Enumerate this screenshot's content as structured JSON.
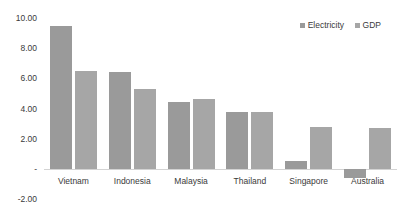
{
  "chart_data": {
    "type": "bar",
    "title": "",
    "subtitle": "",
    "xlabel": "",
    "ylabel": "",
    "categories": [
      "Vietnam",
      "Indonesia",
      "Malaysia",
      "Thailand",
      "Singapore",
      "Australia"
    ],
    "series": [
      {
        "name": "Electricity",
        "color": "#9a9a9a",
        "values": [
          9.5,
          6.4,
          4.4,
          3.8,
          0.5,
          -0.6
        ]
      },
      {
        "name": "GDP",
        "color": "#a6a6a6",
        "values": [
          6.5,
          5.3,
          4.6,
          3.8,
          2.8,
          2.7
        ]
      }
    ],
    "ylim": [
      -2.0,
      10.0
    ],
    "ytick_values": [
      10.0,
      8.0,
      6.0,
      4.0,
      2.0,
      0.0,
      -2.0
    ],
    "ytick_labels": [
      "10.00",
      "8.00",
      "6.00",
      "4.00",
      "2.00",
      "-",
      "(2.00)"
    ],
    "grid": false,
    "legend_position": "top-right",
    "zero_line": true,
    "annotations": []
  },
  "axis": {
    "y_labels": [
      "10.00",
      "8.00",
      "6.00",
      "4.00",
      "2.00",
      "-",
      "-2.00"
    ]
  },
  "legend": {
    "items": [
      {
        "label": "Electricity",
        "color": "#9a9a9a"
      },
      {
        "label": "GDP",
        "color": "#a6a6a6"
      }
    ]
  }
}
